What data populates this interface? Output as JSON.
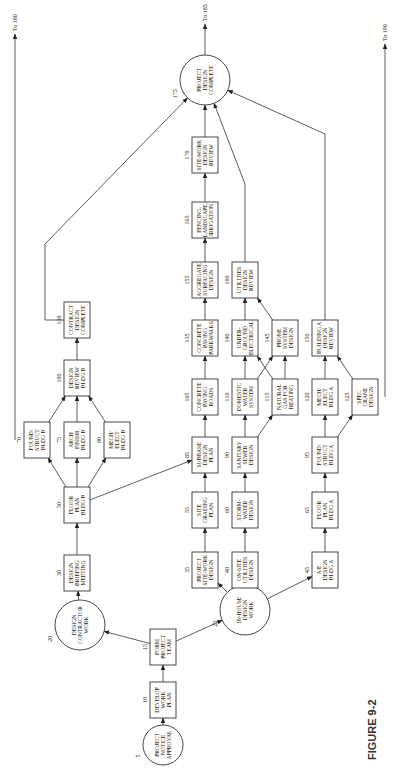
{
  "figure_label": "FIGURE 9-2",
  "nodes": [
    {
      "id": "5",
      "shape": "circle",
      "x": 39,
      "y": 163,
      "r": 20,
      "lines": [
        "PROJECT",
        "NOTICE",
        "APPROVAL"
      ]
    },
    {
      "id": "10",
      "shape": "box",
      "x": 84,
      "y": 163,
      "lines": [
        "DEVELOP",
        "WORK",
        "PLAN"
      ]
    },
    {
      "id": "15",
      "shape": "box",
      "x": 137,
      "y": 163,
      "lines": [
        "FORM",
        "PROJECT",
        "TEAM"
      ]
    },
    {
      "id": "20",
      "shape": "circle",
      "x": 159,
      "y": 80,
      "r": 25,
      "lines": [
        "DESIGN",
        "CONTRACTOR",
        "WORK"
      ]
    },
    {
      "id": "25",
      "shape": "circle",
      "x": 174,
      "y": 245,
      "r": 25,
      "lines": [
        "IN-HOUSE",
        "DESIGN",
        "WORK"
      ]
    },
    {
      "id": "30",
      "shape": "box",
      "x": 211,
      "y": 77,
      "lines": [
        "DESIGN",
        "BRIEFING",
        "MEETING"
      ]
    },
    {
      "id": "50",
      "shape": "box",
      "x": 279,
      "y": 77,
      "lines": [
        "FLOOR",
        "PLAN",
        "BLDG B"
      ]
    },
    {
      "id": "70",
      "shape": "box",
      "x": 344,
      "y": 37,
      "lines": [
        "FOUND/",
        "STRUCT",
        "BLDG B"
      ]
    },
    {
      "id": "75",
      "shape": "box",
      "x": 344,
      "y": 77,
      "lines": [
        "ARCH",
        "FINISH",
        "BLDG B"
      ]
    },
    {
      "id": "80",
      "shape": "box",
      "x": 344,
      "y": 117,
      "lines": [
        "MECH/",
        "ELECT",
        "BLDG B"
      ]
    },
    {
      "id": "100",
      "shape": "box",
      "x": 406,
      "y": 77,
      "lines": [
        "DESIGN",
        "REVIEW",
        "BLDG B"
      ]
    },
    {
      "id": "130",
      "shape": "box",
      "x": 464,
      "y": 77,
      "lines": [
        "CONTRACT",
        "DESIGN",
        "COMPLETE"
      ]
    },
    {
      "id": "35",
      "shape": "box",
      "x": 214,
      "y": 205,
      "lines": [
        "PROJECT",
        "SITE-WORK",
        "DESIGN"
      ]
    },
    {
      "id": "40",
      "shape": "box",
      "x": 214,
      "y": 245,
      "lines": [
        "ON-SITE",
        "UTILITIES",
        "DESIGN"
      ]
    },
    {
      "id": "45",
      "shape": "box",
      "x": 214,
      "y": 325,
      "lines": [
        "A/E",
        "DESIGN",
        "BLDG A"
      ]
    },
    {
      "id": "55",
      "shape": "box",
      "x": 274,
      "y": 205,
      "lines": [
        "SITE",
        "GRADING",
        "PLAN"
      ]
    },
    {
      "id": "60",
      "shape": "box",
      "x": 274,
      "y": 245,
      "lines": [
        "STORM-",
        "WATER",
        "DESIGN"
      ]
    },
    {
      "id": "65",
      "shape": "box",
      "x": 274,
      "y": 325,
      "lines": [
        "FLOOR",
        "PLAN",
        "BLDG A"
      ]
    },
    {
      "id": "85",
      "shape": "box",
      "x": 329,
      "y": 205,
      "lines": [
        "SUBBASE",
        "DESIGN",
        "PLAN"
      ]
    },
    {
      "id": "90",
      "shape": "box",
      "x": 329,
      "y": 245,
      "lines": [
        "SANITARY",
        "SEWER",
        "DESIGN"
      ]
    },
    {
      "id": "95",
      "shape": "box",
      "x": 329,
      "y": 325,
      "lines": [
        "FOUND/",
        "STRUCT",
        "BLDG A"
      ]
    },
    {
      "id": "105",
      "shape": "box",
      "x": 387,
      "y": 205,
      "lines": [
        "CONCRETE",
        "PAVING",
        "ROADS"
      ]
    },
    {
      "id": "110",
      "shape": "box",
      "x": 387,
      "y": 245,
      "lines": [
        "DOMESTIC",
        "WATER",
        "SYSTEM"
      ]
    },
    {
      "id": "115",
      "shape": "box",
      "x": 387,
      "y": 285,
      "lines": [
        "NATURAL",
        "GAS FOR",
        "HEATING"
      ]
    },
    {
      "id": "120",
      "shape": "box",
      "x": 387,
      "y": 325,
      "lines": [
        "MECH/",
        "ELECT",
        "BLDG A"
      ]
    },
    {
      "id": "125",
      "shape": "box",
      "x": 387,
      "y": 365,
      "lines": [
        "SPEC",
        "CRANE",
        "DESIGN"
      ]
    },
    {
      "id": "135",
      "shape": "box",
      "x": 446,
      "y": 205,
      "lines": [
        "CONCRETE",
        "PAVING",
        "PARKWALKS"
      ]
    },
    {
      "id": "140",
      "shape": "box",
      "x": 446,
      "y": 245,
      "lines": [
        "UNDER-",
        "GROUND",
        "ELECTRICAL"
      ]
    },
    {
      "id": "145",
      "shape": "box",
      "x": 446,
      "y": 285,
      "lines": [
        "PHONE",
        "SYSTEM",
        "DESIGN"
      ]
    },
    {
      "id": "150",
      "shape": "box",
      "x": 446,
      "y": 325,
      "lines": [
        "BUILDING A",
        "DESIGN",
        "REVIEW"
      ]
    },
    {
      "id": "155",
      "shape": "box",
      "x": 504,
      "y": 205,
      "lines": [
        "AGGREGATE",
        "SURFACING",
        "DESIGN"
      ]
    },
    {
      "id": "160",
      "shape": "box",
      "x": 504,
      "y": 245,
      "lines": [
        "UTILITIES",
        "DESIGN",
        "REVIEW"
      ]
    },
    {
      "id": "165",
      "shape": "box",
      "x": 564,
      "y": 205,
      "lines": [
        "FENCING,",
        "LANDSCAPE,",
        "IRRIGATION"
      ]
    },
    {
      "id": "170",
      "shape": "box",
      "x": 629,
      "y": 205,
      "lines": [
        "SITE-WORK",
        "DESIGN",
        "REVIEW"
      ]
    },
    {
      "id": "175",
      "shape": "circle",
      "x": 704,
      "y": 205,
      "r": 25,
      "lines": [
        "PROJECT",
        "DESIGN",
        "COMPLETE"
      ]
    }
  ],
  "edges": [
    [
      "5",
      "10"
    ],
    [
      "10",
      "15"
    ],
    [
      "15",
      "20"
    ],
    [
      "15",
      "25"
    ],
    [
      "20",
      "30"
    ],
    [
      "30",
      "50"
    ],
    [
      "50",
      "70"
    ],
    [
      "50",
      "75"
    ],
    [
      "50",
      "80"
    ],
    [
      "50",
      "85"
    ],
    [
      "70",
      "100"
    ],
    [
      "75",
      "100"
    ],
    [
      "80",
      "100"
    ],
    [
      "100",
      "130"
    ],
    [
      "25",
      "35"
    ],
    [
      "25",
      "40"
    ],
    [
      "25",
      "45"
    ],
    [
      "35",
      "55"
    ],
    [
      "40",
      "60"
    ],
    [
      "45",
      "65"
    ],
    [
      "55",
      "85"
    ],
    [
      "60",
      "90"
    ],
    [
      "65",
      "95"
    ],
    [
      "85",
      "105"
    ],
    [
      "90",
      "110"
    ],
    [
      "90",
      "115"
    ],
    [
      "95",
      "120"
    ],
    [
      "95",
      "125"
    ],
    [
      "105",
      "135"
    ],
    [
      "110",
      "140"
    ],
    [
      "110",
      "145"
    ],
    [
      "115",
      "140"
    ],
    [
      "115",
      "145"
    ],
    [
      "120",
      "150"
    ],
    [
      "125",
      "150"
    ],
    [
      "135",
      "155"
    ],
    [
      "140",
      "160"
    ],
    [
      "145",
      "160"
    ],
    [
      "155",
      "165"
    ],
    [
      "165",
      "170"
    ],
    [
      "170",
      "175"
    ]
  ],
  "long_edges": [
    {
      "from": "130",
      "via": [
        [
          464,
          45
        ],
        [
          540,
          45
        ]
      ],
      "to": "175"
    },
    {
      "from": "160",
      "via": [
        [
          600,
          245
        ]
      ],
      "to": "175"
    },
    {
      "from": "150",
      "via": [
        [
          650,
          325
        ]
      ],
      "to": "175"
    }
  ],
  "off_page": [
    {
      "label": "To 180",
      "from": [
        344,
        15
      ],
      "to": [
        750,
        15
      ]
    },
    {
      "label": "To 185",
      "from": [
        729,
        205
      ],
      "to": [
        760,
        205
      ]
    },
    {
      "label": "To 190",
      "from": [
        387,
        385
      ],
      "to": [
        740,
        385
      ]
    }
  ]
}
